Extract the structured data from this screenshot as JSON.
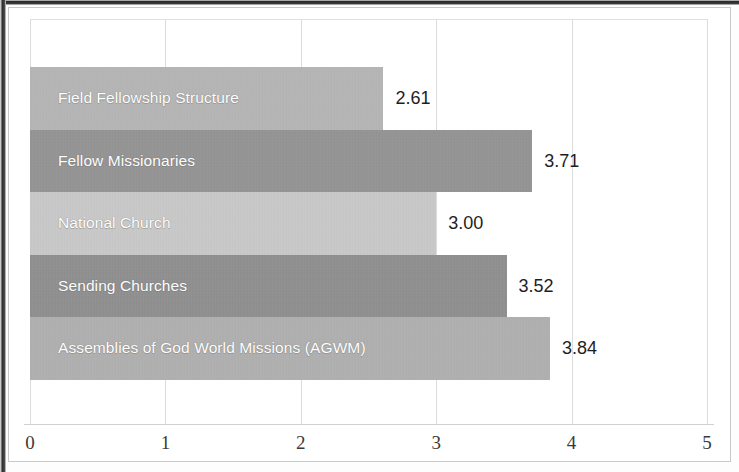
{
  "chart_data": {
    "type": "bar",
    "orientation": "horizontal",
    "title": "",
    "subtitle": "",
    "xlabel": "",
    "ylabel": "",
    "xlim": [
      0,
      5
    ],
    "x_ticks": [
      "0",
      "1",
      "2",
      "3",
      "4",
      "5"
    ],
    "grid": true,
    "legend": "none",
    "categories": [
      "Field Fellowship Structure",
      "Fellow Missionaries",
      "National Church",
      "Sending Churches",
      "Assemblies of God World Missions (AGWM)"
    ],
    "values": [
      2.61,
      3.71,
      3.0,
      3.52,
      3.84
    ],
    "value_labels": [
      "2.61",
      "3.71",
      "3.00",
      "3.52",
      "3.84"
    ],
    "bar_colors": [
      "#b9b9b9",
      "#969696",
      "#cdcdcd",
      "#919191",
      "#b3b3b3"
    ],
    "bar_label_color": "#ffffff",
    "value_label_color": "#1e1e1e",
    "gridline_color": "#dcdcdc",
    "axis_color": "#d2d2d2",
    "background": "#ffffff"
  }
}
